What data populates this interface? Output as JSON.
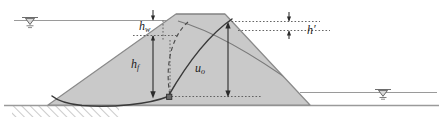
{
  "figure": {
    "domain": "diagram"
  },
  "labels": {
    "h_w": {
      "base": "h",
      "sub": "w",
      "prime": ""
    },
    "h_prime": {
      "base": "h",
      "sub": "",
      "prime": "′"
    },
    "h_f": {
      "base": "h",
      "sub": "f",
      "prime": ""
    },
    "u_o": {
      "base": "u",
      "sub": "o",
      "prime": ""
    }
  },
  "colors": {
    "embankment_fill": "#c9c9c9",
    "embankment_stroke": "#8a8a8a",
    "ground_line": "#9a9a9a",
    "water_line": "#9a9a9a",
    "slip_surface": "#3a3a3a",
    "dashed_curve": "#4a4a4a",
    "dimension_line": "#2b2b2b",
    "dotted_leader": "#555555",
    "hatch": "#8a8a8a",
    "label_text": "#1c1c1c",
    "background": "#ffffff"
  },
  "elements": {
    "upstream_water_surface": "upstream reservoir water level line (left)",
    "downstream_water_surface": "downstream tailwater level line (right)",
    "water_table_symbol_left": "inverted triangle water table marker, upstream",
    "water_table_symbol_right": "inverted triangle water table marker, downstream",
    "ground_surface": "horizontal foundation ground line",
    "foundation_hatching": "diagonal hatch below ground line at left",
    "embankment_body": "trapezoidal earth dam fill",
    "crest": "flat dam crest",
    "phreatic_line": "seepage / phreatic surface through embankment",
    "slip_circle": "solid curved failure surface arc",
    "dashed_arc": "dashed auxiliary arc",
    "node_marker": "small filled square node on slip surface"
  },
  "dimensions": [
    {
      "name": "h_w",
      "description": "head of water above phreatic entry",
      "orientation": "vertical"
    },
    {
      "name": "h_prime",
      "description": "small head difference at downstream side",
      "orientation": "vertical"
    },
    {
      "name": "h_f",
      "description": "depth from water surface to slip node",
      "orientation": "vertical"
    },
    {
      "name": "u_o",
      "description": "pore pressure head at slip node",
      "orientation": "vertical"
    }
  ]
}
